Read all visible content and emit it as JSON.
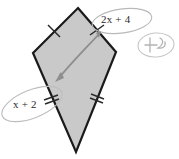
{
  "figure": {
    "name": "kite-geometry-diagram",
    "shape_type": "kite",
    "fill_color": "#c9c9c9",
    "stroke_color": "#1a1a1a",
    "annotation_color": "#9a9a9a",
    "tick_color": "#2a2a2a",
    "arrow_color": "#8a8a8a",
    "background_color": "#ffffff",
    "vertices": {
      "top": {
        "x": 78,
        "y": 8
      },
      "left": {
        "x": 33,
        "y": 53
      },
      "right": {
        "x": 116,
        "y": 52
      },
      "bottom": {
        "x": 76,
        "y": 152
      }
    },
    "tick_marks": [
      {
        "edge": "top-left",
        "count": 1
      },
      {
        "edge": "top-right",
        "count": 1
      },
      {
        "edge": "bottom-left",
        "count": 2
      },
      {
        "edge": "bottom-right",
        "count": 2
      }
    ]
  },
  "labels": {
    "top_right": {
      "expr_coefficient": "2",
      "expr_var": "x",
      "expr_rest": "+ 4",
      "full": "2x + 4",
      "edge": "top-right"
    },
    "bottom_left": {
      "expr_var": "x",
      "expr_rest": "+ 2",
      "full": "x + 2",
      "edge": "bottom-left"
    }
  },
  "annotations": {
    "arrow": {
      "name": "double-headed-arrow",
      "from": {
        "x": 101,
        "y": 32
      },
      "to": {
        "x": 58,
        "y": 79
      },
      "double_headed": true
    },
    "scribble": {
      "name": "handwritten-scribble",
      "description": "faint circled handwritten mark",
      "center": {
        "x": 156,
        "y": 45
      }
    },
    "ellipse_top_right": {
      "name": "hand-drawn-ellipse",
      "center": {
        "x": 122,
        "y": 21
      },
      "rx": 30,
      "ry": 12,
      "rotation": -8
    },
    "ellipse_bottom_left": {
      "name": "hand-drawn-ellipse",
      "center": {
        "x": 32,
        "y": 104
      },
      "rx": 32,
      "ry": 14,
      "rotation": -22
    },
    "ellipse_scribble": {
      "name": "hand-drawn-ellipse",
      "center": {
        "x": 156,
        "y": 45
      },
      "rx": 18,
      "ry": 12,
      "rotation": -5
    }
  }
}
